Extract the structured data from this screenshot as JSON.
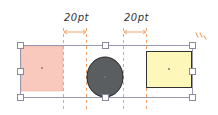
{
  "spacing_labels": [
    "20pt",
    "20pt"
  ],
  "colors": {
    "guide": "#f3a36b",
    "selection": "#9a97b0",
    "square_fill": "#f8c9bc",
    "circle_fill": "#5b5e60",
    "rect_fill": "#fdf7b9",
    "outline": "#333333"
  },
  "shapes": [
    {
      "name": "square",
      "fill": "pink"
    },
    {
      "name": "circle",
      "fill": "gray"
    },
    {
      "name": "rectangle",
      "fill": "yellow"
    }
  ]
}
